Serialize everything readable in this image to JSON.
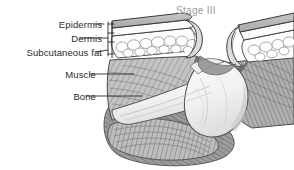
{
  "figure": {
    "title": "Stage III",
    "title_color": "#9a9a9a",
    "background_color": "#ffffff",
    "width": 294,
    "height": 170
  },
  "labels": {
    "epidermis": "Epidermis",
    "dermis": "Dermis",
    "subcutaneous_fat": "Subcutaneous fat",
    "muscle": "Muscle",
    "bone": "Bone"
  },
  "palette": {
    "ink": "#2b2b2b",
    "line": "#3a3a3a",
    "epidermis_fill": "#b9b9b9",
    "dermis_fill": "#fbfbfb",
    "fat_fill": "#fcfcfc",
    "fat_cell_outline": "#8d8d8d",
    "muscle_light": "#c9c9c9",
    "muscle_mid": "#a8a8a8",
    "muscle_dark": "#6f6f6f",
    "muscle_shadow": "#575757",
    "bone_fill": "#f6f6f6",
    "bone_shade": "#d6d6d6",
    "wound_shadow": "#5a5a5a"
  },
  "anatomy": {
    "layers": [
      "epidermis",
      "dermis",
      "subcutaneous_fat",
      "muscle",
      "bone"
    ],
    "stage": 3,
    "description": "Cross-section of a Stage III pressure ulcer with full-thickness skin loss exposing subcutaneous fat, muscle and bone"
  }
}
